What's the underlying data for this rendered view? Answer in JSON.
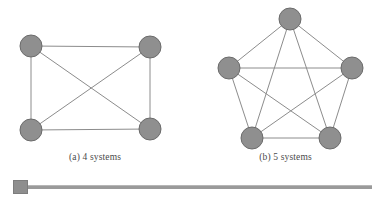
{
  "figure": {
    "caption_a": "(a) 4 systems",
    "caption_b": "(b) 5 systems",
    "node_fill": "#8f8f8f",
    "node_stroke": "#6b6b6b",
    "edge_color": "#8c8c8c",
    "background": "#ffffff"
  },
  "chart_data": {
    "type": "diagram",
    "title": "",
    "subtitle": "",
    "xlabel": "",
    "ylabel": "",
    "grid": false,
    "legend": "none",
    "graphs": [
      {
        "id": "graph-4-systems",
        "label": "(a) 4 systems",
        "graph_type": "complete",
        "node_count": 4,
        "edge_count": 6,
        "node_radius": 11,
        "nodes": [
          {
            "id": "n1",
            "x": 31,
            "y": 46
          },
          {
            "id": "n2",
            "x": 150,
            "y": 47
          },
          {
            "id": "n3",
            "x": 31,
            "y": 130
          },
          {
            "id": "n4",
            "x": 150,
            "y": 129
          }
        ],
        "edges": [
          {
            "from": "n1",
            "to": "n2"
          },
          {
            "from": "n1",
            "to": "n3"
          },
          {
            "from": "n1",
            "to": "n4"
          },
          {
            "from": "n2",
            "to": "n3"
          },
          {
            "from": "n2",
            "to": "n4"
          },
          {
            "from": "n3",
            "to": "n4"
          }
        ]
      },
      {
        "id": "graph-5-systems",
        "label": "(b) 5 systems",
        "graph_type": "complete",
        "node_count": 5,
        "edge_count": 10,
        "node_radius": 11,
        "nodes": [
          {
            "id": "m1",
            "x": 290,
            "y": 19
          },
          {
            "id": "m2",
            "x": 229,
            "y": 68
          },
          {
            "id": "m3",
            "x": 352,
            "y": 68
          },
          {
            "id": "m4",
            "x": 252,
            "y": 138
          },
          {
            "id": "m5",
            "x": 330,
            "y": 138
          }
        ],
        "edges": [
          {
            "from": "m1",
            "to": "m2"
          },
          {
            "from": "m1",
            "to": "m3"
          },
          {
            "from": "m1",
            "to": "m4"
          },
          {
            "from": "m1",
            "to": "m5"
          },
          {
            "from": "m2",
            "to": "m3"
          },
          {
            "from": "m2",
            "to": "m4"
          },
          {
            "from": "m2",
            "to": "m5"
          },
          {
            "from": "m3",
            "to": "m4"
          },
          {
            "from": "m3",
            "to": "m5"
          },
          {
            "from": "m4",
            "to": "m5"
          }
        ]
      }
    ]
  },
  "scrollbar": {
    "orientation": "horizontal",
    "thumb_position": "left",
    "thumb_label": ""
  }
}
